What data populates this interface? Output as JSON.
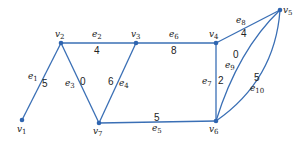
{
  "diagram": {
    "type": "weighted-graph",
    "edge_color": "#3a6fb5",
    "vertex_color": "#2f65b0",
    "vertices": [
      {
        "id": "v1",
        "label": "v",
        "sub": "1",
        "x": 22,
        "y": 120
      },
      {
        "id": "v2",
        "label": "v",
        "sub": "2",
        "x": 61,
        "y": 43
      },
      {
        "id": "v3",
        "label": "v",
        "sub": "3",
        "x": 136,
        "y": 43
      },
      {
        "id": "v4",
        "label": "v",
        "sub": "4",
        "x": 216,
        "y": 43
      },
      {
        "id": "v5",
        "label": "v",
        "sub": "5",
        "x": 280,
        "y": 10
      },
      {
        "id": "v6",
        "label": "v",
        "sub": "6",
        "x": 216,
        "y": 121
      },
      {
        "id": "v7",
        "label": "v",
        "sub": "7",
        "x": 99,
        "y": 123
      }
    ],
    "edges": [
      {
        "id": "e1",
        "label": "e",
        "sub": "1",
        "from": "v1",
        "to": "v2",
        "weight": "5"
      },
      {
        "id": "e2",
        "label": "e",
        "sub": "2",
        "from": "v2",
        "to": "v3",
        "weight": "4"
      },
      {
        "id": "e3",
        "label": "e",
        "sub": "3",
        "from": "v2",
        "to": "v7",
        "weight": "0"
      },
      {
        "id": "e4",
        "label": "e",
        "sub": "4",
        "from": "v3",
        "to": "v7",
        "weight": "6"
      },
      {
        "id": "e5",
        "label": "e",
        "sub": "5",
        "from": "v7",
        "to": "v6",
        "weight": "5"
      },
      {
        "id": "e6",
        "label": "e",
        "sub": "6",
        "from": "v3",
        "to": "v4",
        "weight": "8"
      },
      {
        "id": "e7",
        "label": "e",
        "sub": "7",
        "from": "v4",
        "to": "v6",
        "weight": "2"
      },
      {
        "id": "e8",
        "label": "e",
        "sub": "8",
        "from": "v4",
        "to": "v5",
        "weight": "4"
      },
      {
        "id": "e9",
        "label": "e",
        "sub": "9",
        "from": "v6",
        "to": "v5",
        "weight": "0"
      },
      {
        "id": "e10",
        "label": "e",
        "sub": "10",
        "from": "v6",
        "to": "v5",
        "weight": "5"
      }
    ]
  }
}
